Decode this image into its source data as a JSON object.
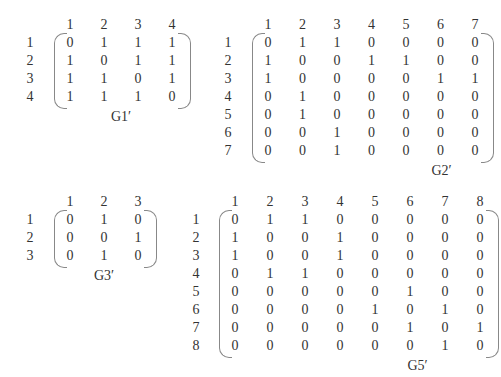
{
  "matrices": [
    {
      "id": "G1",
      "caption": "G1′",
      "col_labels": [
        "1",
        "2",
        "3",
        "4"
      ],
      "row_labels": [
        "1",
        "2",
        "3",
        "4"
      ],
      "rows": [
        [
          "0",
          "1",
          "1",
          "1"
        ],
        [
          "1",
          "0",
          "1",
          "1"
        ],
        [
          "1",
          "1",
          "0",
          "1"
        ],
        [
          "1",
          "1",
          "1",
          "0"
        ]
      ]
    },
    {
      "id": "G2",
      "caption": "G2′",
      "col_labels": [
        "1",
        "2",
        "3",
        "4",
        "5",
        "6",
        "7"
      ],
      "row_labels": [
        "1",
        "2",
        "3",
        "4",
        "5",
        "6",
        "7"
      ],
      "rows": [
        [
          "0",
          "1",
          "1",
          "0",
          "0",
          "0",
          "0"
        ],
        [
          "1",
          "0",
          "0",
          "1",
          "1",
          "0",
          "0"
        ],
        [
          "1",
          "0",
          "0",
          "0",
          "0",
          "1",
          "1"
        ],
        [
          "0",
          "1",
          "0",
          "0",
          "0",
          "0",
          "0"
        ],
        [
          "0",
          "1",
          "0",
          "0",
          "0",
          "0",
          "0"
        ],
        [
          "0",
          "0",
          "1",
          "0",
          "0",
          "0",
          "0"
        ],
        [
          "0",
          "0",
          "1",
          "0",
          "0",
          "0",
          "0"
        ]
      ]
    },
    {
      "id": "G3",
      "caption": "G3′",
      "col_labels": [
        "1",
        "2",
        "3"
      ],
      "row_labels": [
        "1",
        "2",
        "3"
      ],
      "rows": [
        [
          "0",
          "1",
          "0"
        ],
        [
          "0",
          "0",
          "1"
        ],
        [
          "0",
          "1",
          "0"
        ]
      ]
    },
    {
      "id": "G5",
      "caption": "G5′",
      "col_labels": [
        "1",
        "2",
        "3",
        "4",
        "5",
        "6",
        "7",
        "8"
      ],
      "row_labels": [
        "1",
        "2",
        "3",
        "4",
        "5",
        "6",
        "7",
        "8"
      ],
      "rows": [
        [
          "0",
          "1",
          "1",
          "0",
          "0",
          "0",
          "0",
          "0"
        ],
        [
          "1",
          "0",
          "0",
          "1",
          "0",
          "0",
          "0",
          "0"
        ],
        [
          "1",
          "0",
          "0",
          "1",
          "0",
          "0",
          "0",
          "0"
        ],
        [
          "0",
          "1",
          "1",
          "0",
          "0",
          "0",
          "0",
          "0"
        ],
        [
          "0",
          "0",
          "0",
          "0",
          "0",
          "1",
          "0",
          "0"
        ],
        [
          "0",
          "0",
          "0",
          "0",
          "1",
          "0",
          "1",
          "0"
        ],
        [
          "0",
          "0",
          "0",
          "0",
          "0",
          "1",
          "0",
          "1"
        ],
        [
          "0",
          "0",
          "0",
          "0",
          "0",
          "0",
          "1",
          "0"
        ]
      ]
    }
  ]
}
